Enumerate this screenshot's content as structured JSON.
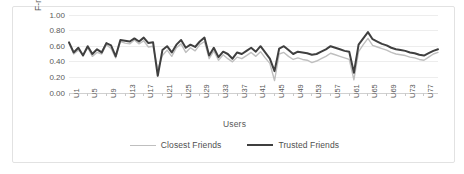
{
  "chart_data": {
    "type": "line",
    "title": "",
    "xlabel": "Users",
    "ylabel": "F-measure",
    "ylim": [
      0.0,
      1.0
    ],
    "ytick_values": [
      0.0,
      0.2,
      0.4,
      0.6,
      0.8,
      1.0
    ],
    "ytick_labels": [
      "0.00",
      "0.20",
      "0.40",
      "0.60",
      "0.80",
      "1.00"
    ],
    "grid": true,
    "grid_axis": "y",
    "legend_position": "bottom",
    "x": [
      "U1",
      "U2",
      "U3",
      "U4",
      "U5",
      "U6",
      "U7",
      "U8",
      "U9",
      "U10",
      "U11",
      "U12",
      "U13",
      "U14",
      "U15",
      "U16",
      "U17",
      "U18",
      "U19",
      "U20",
      "U21",
      "U22",
      "U23",
      "U24",
      "U25",
      "U26",
      "U27",
      "U28",
      "U29",
      "U30",
      "U31",
      "U32",
      "U33",
      "U34",
      "U35",
      "U36",
      "U37",
      "U38",
      "U39",
      "U40",
      "U41",
      "U42",
      "U43",
      "U44",
      "U45",
      "U46",
      "U47",
      "U48",
      "U49",
      "U50",
      "U51",
      "U52",
      "U53",
      "U54",
      "U55",
      "U56",
      "U57",
      "U58",
      "U59",
      "U60",
      "U61",
      "U62",
      "U63",
      "U64",
      "U65",
      "U66",
      "U67",
      "U68",
      "U69",
      "U70",
      "U71",
      "U72",
      "U73",
      "U74",
      "U75",
      "U76",
      "U77",
      "U78",
      "U79",
      "U80"
    ],
    "xtick_labels": [
      "U1",
      "U5",
      "U9",
      "U13",
      "U17",
      "U21",
      "U25",
      "U29",
      "U33",
      "U37",
      "U41",
      "U45",
      "U49",
      "U53",
      "U57",
      "U61",
      "U65",
      "U69",
      "U73",
      "U77"
    ],
    "xtick_every": 4,
    "series": [
      {
        "name": "Closest Friends",
        "color": "#bfbfbf",
        "line_width": 1.4,
        "values": [
          0.64,
          0.5,
          0.55,
          0.49,
          0.58,
          0.47,
          0.52,
          0.5,
          0.62,
          0.57,
          0.45,
          0.66,
          0.64,
          0.63,
          0.68,
          0.63,
          0.67,
          0.59,
          0.6,
          0.3,
          0.48,
          0.55,
          0.47,
          0.58,
          0.63,
          0.52,
          0.58,
          0.54,
          0.62,
          0.66,
          0.44,
          0.54,
          0.42,
          0.49,
          0.44,
          0.4,
          0.46,
          0.44,
          0.48,
          0.52,
          0.47,
          0.53,
          0.45,
          0.38,
          0.16,
          0.5,
          0.52,
          0.47,
          0.43,
          0.45,
          0.43,
          0.42,
          0.39,
          0.41,
          0.44,
          0.47,
          0.51,
          0.49,
          0.47,
          0.45,
          0.43,
          0.17,
          0.53,
          0.62,
          0.7,
          0.61,
          0.59,
          0.57,
          0.55,
          0.52,
          0.5,
          0.49,
          0.48,
          0.46,
          0.45,
          0.43,
          0.42,
          0.46,
          0.5,
          0.52
        ]
      },
      {
        "name": "Trusted Friends",
        "color": "#3f3f3f",
        "line_width": 2.0,
        "values": [
          0.65,
          0.52,
          0.58,
          0.48,
          0.6,
          0.5,
          0.56,
          0.52,
          0.64,
          0.61,
          0.47,
          0.68,
          0.67,
          0.66,
          0.7,
          0.66,
          0.71,
          0.64,
          0.65,
          0.22,
          0.55,
          0.6,
          0.52,
          0.62,
          0.68,
          0.58,
          0.62,
          0.59,
          0.66,
          0.71,
          0.48,
          0.58,
          0.46,
          0.53,
          0.5,
          0.44,
          0.52,
          0.5,
          0.54,
          0.58,
          0.53,
          0.6,
          0.52,
          0.44,
          0.28,
          0.57,
          0.6,
          0.55,
          0.5,
          0.53,
          0.52,
          0.51,
          0.49,
          0.5,
          0.53,
          0.56,
          0.6,
          0.58,
          0.56,
          0.54,
          0.53,
          0.26,
          0.62,
          0.7,
          0.78,
          0.69,
          0.66,
          0.63,
          0.61,
          0.58,
          0.56,
          0.55,
          0.54,
          0.52,
          0.51,
          0.49,
          0.48,
          0.51,
          0.54,
          0.56
        ]
      }
    ]
  }
}
